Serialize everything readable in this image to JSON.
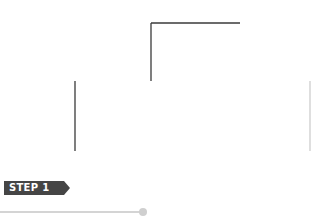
{
  "step": {
    "label": "STEP 1",
    "badge_color": "#454545",
    "text_color": "#ffffff"
  },
  "progress": {
    "track_color": "#d4d4d4",
    "knob_color": "#cfcfcf"
  },
  "diagram": {
    "line_color": "#3a3a3a",
    "top_box": {
      "x": 151,
      "y": 23,
      "w": 89,
      "h": 58
    },
    "main_box": {
      "x": 75,
      "y": 81,
      "w": 235,
      "h": 70
    },
    "horizontal_guide_y": 120,
    "vertical_guides_x": [
      167,
      196,
      223
    ]
  }
}
